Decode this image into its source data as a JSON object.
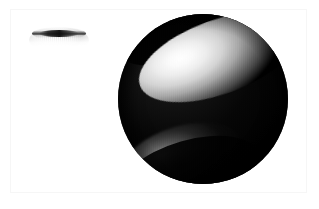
{
  "canvas": {
    "width": 319,
    "height": 209,
    "background_color": "#ffffff",
    "frame_color": "#e9e9e9",
    "caption": ""
  },
  "objects": [
    {
      "name": "small-lens-ellipsoid",
      "label": "Flattened ellipsoid",
      "center_x": 59,
      "center_y": 34,
      "width": 62,
      "height": 20,
      "base_color": "#f4f4f4",
      "edge_color": "#1a1a1a",
      "description": "Pale grey flattened ellipsoid seen nearly edge-on with a dark arc along its upper rim"
    },
    {
      "name": "large-sphere",
      "label": "Shaded sphere",
      "center_x": 203,
      "center_y": 99,
      "radius": 85,
      "base_color": "#050505",
      "highlight_color": "#ffffff",
      "description": "Large near-black sphere with a bright tilted elliptical specular band across the upper hemisphere and a faint crescent highlight at the lower left"
    }
  ],
  "lighting": {
    "primary_highlight": {
      "name": "primary-specular-band",
      "shape": "ellipse",
      "rotation_deg": -20,
      "center_x": 203,
      "center_y": 60,
      "width": 168,
      "height": 74,
      "core_color": "#ffffff",
      "falloff_color": "#000000"
    },
    "secondary_highlight": {
      "name": "secondary-crescent",
      "shape": "crescent",
      "rotation_deg": -16,
      "center_x": 182,
      "center_y": 154,
      "width": 118,
      "height": 56,
      "core_color": "#b0b0b0"
    }
  },
  "render": {
    "texture": "horizontal-dither-scanlines",
    "palette": "grayscale"
  }
}
